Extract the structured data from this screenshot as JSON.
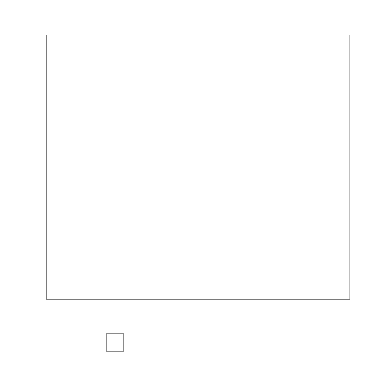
{
  "chart_data": {
    "type": "area",
    "stacked": true,
    "xlabel": "",
    "ylabel": "",
    "xlim": [
      1995,
      2018.5
    ],
    "ylim": [
      0,
      70
    ],
    "grid": true,
    "legend_position": "bottom",
    "y_ticks": [
      0,
      10,
      20,
      30,
      40,
      50,
      60,
      70
    ],
    "y_tick_labels": [
      "0%",
      "10%",
      "20%",
      "30%",
      "40%",
      "50%",
      "60%",
      "70%"
    ],
    "x_ticks": [
      1995,
      2000,
      2005,
      2010,
      2015
    ],
    "x_tick_labels": [
      "1995",
      "2000",
      "2005",
      "2010",
      "2015"
    ],
    "x": [
      1995.3,
      1996,
      1997,
      1998,
      1999,
      2000,
      2001,
      2002,
      2003,
      2004,
      2005,
      2006,
      2007,
      2008,
      2009,
      2010,
      2011,
      2012,
      2013,
      2014,
      2015,
      2016,
      2017,
      2018.5
    ],
    "series": [
      {
        "name": "Wholly owned",
        "color": "#d0d0d0",
        "values": [
          13.0,
          14.0,
          16.0,
          18.0,
          20.0,
          22.5,
          25.0,
          28.0,
          31.0,
          34.0,
          36.0,
          37.0,
          37.5,
          37.0,
          38.5,
          39.5,
          38.5,
          36.5,
          35.0,
          34.0,
          33.0,
          32.5,
          32.0,
          31.0
        ]
      },
      {
        "name": "Joint ventures",
        "color": "#989898",
        "values": [
          18.5,
          21.0,
          24.0,
          25.5,
          25.5,
          25.0,
          24.0,
          22.5,
          21.0,
          20.0,
          19.5,
          19.5,
          18.0,
          17.0,
          17.5,
          15.5,
          14.5,
          14.0,
          13.5,
          12.5,
          12.0,
          11.5,
          10.5,
          10.0
        ]
      }
    ],
    "total_values": [
      31.5,
      35.0,
      40.0,
      43.5,
      45.5,
      47.5,
      49.0,
      50.5,
      52.0,
      54.0,
      55.5,
      56.5,
      55.5,
      54.0,
      56.0,
      55.0,
      53.0,
      50.5,
      48.5,
      46.5,
      45.0,
      44.0,
      42.5,
      41.0
    ]
  },
  "legend": {
    "entries": [
      {
        "label": "Joint ventures",
        "color": "#989898"
      },
      {
        "label": "Wholly owned",
        "color": "#d0d0d0"
      }
    ]
  }
}
